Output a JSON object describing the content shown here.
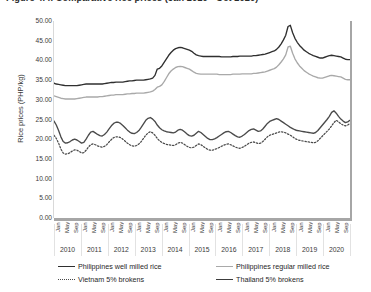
{
  "figure": {
    "title": "Figure 4.4.  Comparative rice prices (Jan 2010 - Oct 2020)"
  },
  "chart_data": {
    "type": "line",
    "title": "Figure 4.4.  Comparative rice prices (Jan 2010 - Oct 2020)",
    "xlabel": "",
    "ylabel": "Rice prices (PHP/kg)",
    "ylim": [
      0,
      50
    ],
    "ytick_labels": [
      "50.00",
      "45.00",
      "40.00",
      "35.00",
      "30.00",
      "25.00",
      "20.00",
      "15.00",
      "10.00",
      "5.00",
      "0.00"
    ],
    "ytick_values": [
      50,
      45,
      40,
      35,
      30,
      25,
      20,
      15,
      10,
      5,
      0
    ],
    "grid": false,
    "legend_position": "bottom",
    "x_month_labels": [
      "Jan",
      "May",
      "Sep"
    ],
    "years": [
      "2010",
      "2011",
      "2012",
      "2013",
      "2014",
      "2015",
      "2016",
      "2017",
      "2018",
      "2019",
      "2020"
    ],
    "x_start": "Jan 2010",
    "x_end": "Oct 2020",
    "series": [
      {
        "name": "Philippines well milled rice",
        "style": "solid",
        "color": "#2f2f2f",
        "values": [
          34.2,
          34.0,
          33.9,
          33.8,
          33.7,
          33.6,
          33.6,
          33.6,
          33.6,
          33.6,
          33.6,
          33.7,
          33.8,
          33.9,
          34.0,
          34.0,
          34.0,
          34.0,
          34.0,
          34.0,
          34.0,
          34.0,
          34.1,
          34.2,
          34.3,
          34.4,
          34.4,
          34.5,
          34.5,
          34.5,
          34.5,
          34.6,
          34.7,
          34.8,
          34.8,
          34.9,
          35.0,
          35.0,
          35.0,
          35.0,
          35.1,
          35.2,
          35.3,
          35.5,
          36.2,
          37.8,
          38.0,
          38.6,
          39.5,
          40.4,
          41.3,
          42.0,
          42.6,
          43.0,
          43.2,
          43.3,
          43.2,
          43.0,
          42.8,
          42.6,
          42.3,
          41.8,
          41.4,
          41.2,
          41.1,
          41.0,
          41.0,
          41.0,
          41.0,
          41.0,
          41.0,
          41.0,
          41.0,
          40.9,
          40.9,
          40.9,
          40.9,
          40.9,
          41.0,
          41.0,
          41.0,
          41.1,
          41.1,
          41.1,
          41.1,
          41.1,
          41.1,
          41.2,
          41.2,
          41.3,
          41.4,
          41.5,
          41.6,
          41.8,
          42.0,
          42.2,
          42.4,
          42.8,
          43.4,
          44.2,
          45.2,
          46.4,
          48.6,
          48.9,
          47.0,
          45.6,
          44.6,
          43.8,
          43.2,
          42.6,
          42.2,
          41.8,
          41.5,
          41.2,
          41.0,
          40.8,
          40.6,
          40.6,
          40.8,
          41.0,
          41.2,
          41.3,
          41.2,
          41.1,
          41.0,
          40.9,
          40.6,
          40.3,
          40.2,
          40.2
        ]
      },
      {
        "name": "Philippines regular milled rice",
        "style": "solid",
        "color": "#a9a9a9",
        "values": [
          31.0,
          30.8,
          30.6,
          30.4,
          30.3,
          30.2,
          30.2,
          30.2,
          30.2,
          30.2,
          30.3,
          30.4,
          30.5,
          30.6,
          30.7,
          30.7,
          30.7,
          30.7,
          30.7,
          30.7,
          30.8,
          30.8,
          30.9,
          31.0,
          31.1,
          31.2,
          31.2,
          31.3,
          31.3,
          31.3,
          31.3,
          31.4,
          31.5,
          31.5,
          31.6,
          31.6,
          31.7,
          31.7,
          31.7,
          31.7,
          31.8,
          31.9,
          32.0,
          32.2,
          32.6,
          33.2,
          33.4,
          33.8,
          34.6,
          35.6,
          36.6,
          37.3,
          37.8,
          38.2,
          38.4,
          38.5,
          38.4,
          38.2,
          38.0,
          37.8,
          37.4,
          37.0,
          36.7,
          36.6,
          36.5,
          36.5,
          36.5,
          36.5,
          36.5,
          36.5,
          36.5,
          36.5,
          36.4,
          36.4,
          36.4,
          36.4,
          36.4,
          36.4,
          36.5,
          36.5,
          36.5,
          36.5,
          36.6,
          36.6,
          36.6,
          36.6,
          36.6,
          36.7,
          36.7,
          36.8,
          36.9,
          37.0,
          37.1,
          37.3,
          37.5,
          37.7,
          37.9,
          38.3,
          38.9,
          39.6,
          40.4,
          41.4,
          43.4,
          43.6,
          41.8,
          40.4,
          39.4,
          38.6,
          38.0,
          37.4,
          37.0,
          36.6,
          36.3,
          36.0,
          35.8,
          35.6,
          35.5,
          35.5,
          35.7,
          35.9,
          36.1,
          36.2,
          36.1,
          36.0,
          35.9,
          35.8,
          35.5,
          35.2,
          35.1,
          35.1
        ]
      },
      {
        "name": "Vietnam 5% brokens",
        "style": "dotted",
        "color": "#4a4a4a",
        "values": [
          21.0,
          20.2,
          19.0,
          17.5,
          16.5,
          16.2,
          16.3,
          16.6,
          17.0,
          17.3,
          17.2,
          16.9,
          16.5,
          16.6,
          17.2,
          18.0,
          18.6,
          18.8,
          18.6,
          18.3,
          18.1,
          18.0,
          18.2,
          18.6,
          19.3,
          19.9,
          20.4,
          20.6,
          20.6,
          20.4,
          20.0,
          19.5,
          19.0,
          18.6,
          18.3,
          18.2,
          18.4,
          18.8,
          19.4,
          20.2,
          21.0,
          21.6,
          21.9,
          21.6,
          21.0,
          20.2,
          19.6,
          19.2,
          18.9,
          18.7,
          18.6,
          18.5,
          18.4,
          18.6,
          19.0,
          19.2,
          19.0,
          18.6,
          18.2,
          17.9,
          17.8,
          18.0,
          18.4,
          18.8,
          18.6,
          18.2,
          17.8,
          17.4,
          17.2,
          17.2,
          17.4,
          17.6,
          17.9,
          18.2,
          18.5,
          18.7,
          18.8,
          18.6,
          18.3,
          18.0,
          17.8,
          17.7,
          17.9,
          18.2,
          18.6,
          19.0,
          19.2,
          19.3,
          19.1,
          18.9,
          19.0,
          19.4,
          20.0,
          20.6,
          21.0,
          21.2,
          21.4,
          21.6,
          21.8,
          21.9,
          21.8,
          21.6,
          21.3,
          21.0,
          20.6,
          20.2,
          19.9,
          19.7,
          19.6,
          19.5,
          19.4,
          19.3,
          19.2,
          19.1,
          19.2,
          19.6,
          20.2,
          20.8,
          21.4,
          22.0,
          22.6,
          23.4,
          24.2,
          24.8,
          24.4,
          23.9,
          23.6,
          23.4,
          23.6,
          24.0
        ]
      },
      {
        "name": "Thailand 5% brokens",
        "style": "solid",
        "color": "#4a4a4a",
        "values": [
          24.6,
          23.6,
          22.2,
          20.6,
          19.4,
          19.0,
          19.1,
          19.4,
          19.8,
          20.0,
          19.8,
          19.4,
          19.0,
          19.2,
          20.0,
          21.0,
          21.8,
          22.0,
          21.6,
          21.2,
          20.9,
          20.8,
          21.2,
          21.8,
          22.6,
          23.4,
          24.0,
          24.3,
          24.3,
          24.0,
          23.5,
          22.9,
          22.3,
          21.8,
          21.5,
          21.4,
          21.7,
          22.2,
          23.0,
          23.9,
          24.8,
          25.3,
          25.5,
          25.1,
          24.5,
          23.6,
          22.9,
          22.4,
          22.1,
          21.9,
          21.8,
          21.7,
          21.6,
          21.8,
          22.3,
          22.5,
          22.3,
          21.8,
          21.3,
          20.9,
          20.8,
          21.0,
          21.5,
          22.0,
          21.7,
          21.2,
          20.7,
          20.2,
          19.9,
          19.9,
          20.1,
          20.4,
          20.8,
          21.2,
          21.6,
          21.9,
          22.0,
          21.7,
          21.3,
          20.9,
          20.6,
          20.5,
          20.8,
          21.2,
          21.7,
          22.2,
          22.5,
          22.6,
          22.3,
          22.0,
          22.1,
          22.6,
          23.3,
          24.0,
          24.5,
          24.8,
          25.0,
          25.2,
          25.0,
          24.6,
          24.2,
          23.8,
          23.4,
          23.0,
          22.7,
          22.4,
          22.2,
          22.1,
          22.0,
          21.9,
          21.8,
          21.7,
          21.6,
          21.5,
          21.7,
          22.2,
          22.9,
          23.6,
          24.3,
          25.0,
          25.8,
          26.8,
          27.2,
          26.6,
          25.8,
          25.1,
          24.6,
          24.2,
          24.4,
          24.8
        ]
      }
    ]
  },
  "legend": {
    "items": [
      {
        "label": "Philippines well milled rice",
        "swatch": "solid-dark"
      },
      {
        "label": "Philippines regular milled rice",
        "swatch": "solid-gray"
      },
      {
        "label": "Vietnam 5% brokens",
        "swatch": "dotted"
      },
      {
        "label": "Thailand 5% brokens",
        "swatch": "solid-dark2"
      }
    ]
  }
}
